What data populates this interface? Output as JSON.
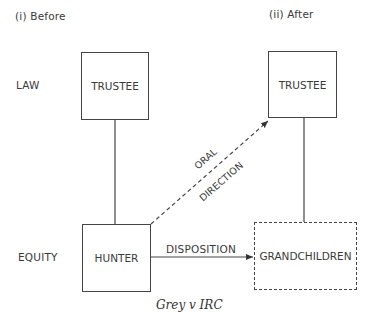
{
  "panels": {
    "before": "(i)  Before",
    "after": "(ii)  After"
  },
  "rows": {
    "law": "LAW",
    "equity": "EQUITY"
  },
  "nodes": {
    "trustee_before": "TRUSTEE",
    "trustee_after": "TRUSTEE",
    "hunter": "HUNTER",
    "grandchildren": "GRANDCHILDREN"
  },
  "edges": {
    "oral_direction_line1": "ORAL",
    "oral_direction_line2": "DIRECTION",
    "disposition": "DISPOSITION"
  },
  "caption": "Grey v IRC"
}
